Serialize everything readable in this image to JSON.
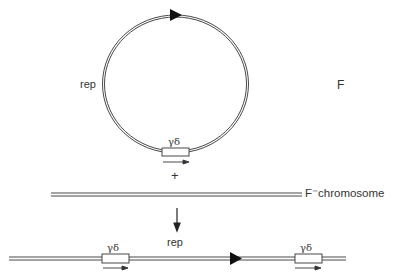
{
  "plasmid": {
    "label": "F",
    "rep_label": "rep",
    "element_label": "γδ"
  },
  "operator": {
    "plus": "+"
  },
  "chromosome": {
    "label": "F⁻chromosome"
  },
  "result": {
    "rep_label": "rep",
    "element_left_label": "γδ",
    "element_right_label": "γδ"
  },
  "colors": {
    "line": "#333333",
    "background": "#ffffff"
  }
}
